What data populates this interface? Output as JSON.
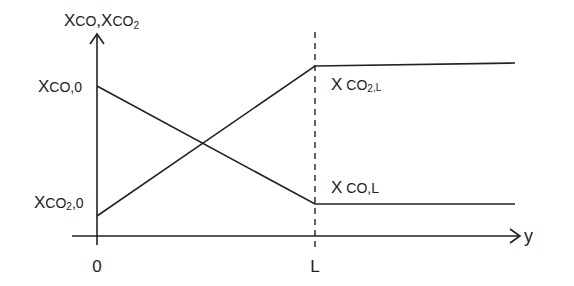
{
  "diagram": {
    "type": "concentration-profile",
    "y_axis": {
      "label_main": "X",
      "label_sub1": "CO",
      "label_sep": ",X",
      "label_sub2": "CO",
      "label_sub2_index": "2"
    },
    "x_axis": {
      "label": "y",
      "ticks": [
        {
          "label": "0",
          "position": "origin"
        },
        {
          "label": "L",
          "position": "boundary"
        }
      ]
    },
    "boundary_line": {
      "style": "dashed",
      "at": "L"
    },
    "series": [
      {
        "name": "X_CO",
        "start_label": {
          "main": "X",
          "sub": "CO,0"
        },
        "end_label": {
          "main": "X",
          "sub": "CO,L"
        },
        "trend": "decreasing linearly from 0 to L, constant after L"
      },
      {
        "name": "X_CO2",
        "start_label": {
          "main": "X",
          "sub_a": "CO",
          "sub_index": "2",
          "sub_b": ",0"
        },
        "end_label": {
          "main": "X",
          "sub_a": "CO",
          "sub_index": "2",
          "sub_b": ",L"
        },
        "trend": "increasing linearly from 0 to L, constant after L"
      }
    ],
    "colors": {
      "line": "#222222",
      "background": "#ffffff"
    }
  }
}
